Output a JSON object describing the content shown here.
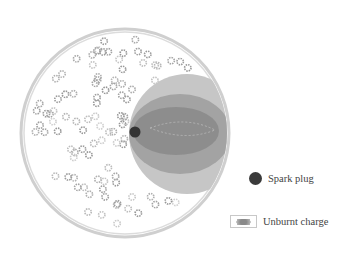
{
  "diagram": {
    "colors": {
      "chamber_wall": "#c9c9c9",
      "outer_flame": "#c4c4c4",
      "middle_flame": "#9c9c9c",
      "inner_flame": "#8a8a8a",
      "spark_plug": "#333333",
      "charge_particle": "#b5b5b5"
    }
  },
  "legend": {
    "items": [
      {
        "id": "spark-plug",
        "label": "Spark plug"
      },
      {
        "id": "unburnt-charge",
        "label": "Unburnt charge"
      }
    ]
  }
}
